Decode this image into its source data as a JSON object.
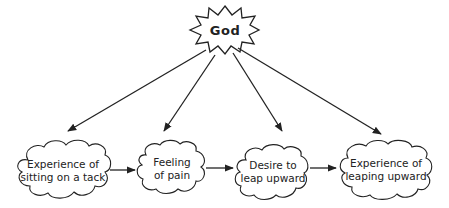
{
  "diagram": {
    "source_node": {
      "label": "God",
      "shape": "starburst"
    },
    "nodes": [
      {
        "id": "n1",
        "line1": "Experience of",
        "line2": "sitting on a tack",
        "shape": "cloud"
      },
      {
        "id": "n2",
        "line1": "Feeling",
        "line2": "of pain",
        "shape": "cloud"
      },
      {
        "id": "n3",
        "line1": "Desire to",
        "line2": "leap upward",
        "shape": "cloud"
      },
      {
        "id": "n4",
        "line1": "Experience of",
        "line2": "leaping upward",
        "shape": "cloud"
      }
    ],
    "edges": [
      {
        "from": "God",
        "to": "n1"
      },
      {
        "from": "God",
        "to": "n2"
      },
      {
        "from": "God",
        "to": "n3"
      },
      {
        "from": "God",
        "to": "n4"
      },
      {
        "from": "n1",
        "to": "n2"
      },
      {
        "from": "n2",
        "to": "n3"
      },
      {
        "from": "n3",
        "to": "n4"
      }
    ],
    "colors": {
      "stroke": "#222222",
      "fill": "#ffffff",
      "text": "#222222"
    }
  }
}
